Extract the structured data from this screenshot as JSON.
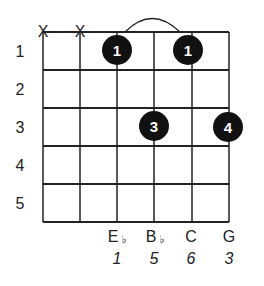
{
  "chord": {
    "fret_numbers": [
      "1",
      "2",
      "3",
      "4",
      "5"
    ],
    "muted_strings": [
      1,
      2
    ],
    "muted_marker": "X",
    "barre": {
      "fret": 1,
      "from_string": 3,
      "to_string": 5
    },
    "fingers": [
      {
        "string": 3,
        "fret": 1,
        "label": "1"
      },
      {
        "string": 5,
        "fret": 1,
        "label": "1"
      },
      {
        "string": 4,
        "fret": 3,
        "label": "3"
      },
      {
        "string": 6,
        "fret": 3,
        "label": "4"
      }
    ],
    "notes": [
      {
        "string": 3,
        "letter": "E",
        "flat": "♭",
        "interval": "1"
      },
      {
        "string": 4,
        "letter": "B",
        "flat": "♭",
        "interval": "5"
      },
      {
        "string": 5,
        "letter": "C",
        "flat": "",
        "interval": "6"
      },
      {
        "string": 6,
        "letter": "G",
        "flat": "",
        "interval": "3"
      }
    ]
  },
  "colors": {
    "ink": "#222222",
    "dot": "#111111",
    "dot_text": "#ffffff",
    "background": "#ffffff"
  }
}
